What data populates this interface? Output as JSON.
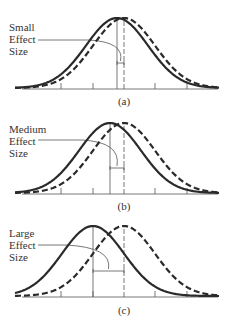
{
  "colors": {
    "curve": "#2a2a2a",
    "axis": "#555555",
    "text": "#333333"
  },
  "chart_data": [
    {
      "type": "line",
      "title": "",
      "caption": "(a)",
      "annotation": [
        "Small",
        "Effect",
        "Size"
      ],
      "series": [
        {
          "name": "distribution-1",
          "style": "solid",
          "mean_x_px": 117
        },
        {
          "name": "distribution-2",
          "style": "dashed",
          "mean_x_px": 124
        }
      ],
      "effect_size": "small",
      "grid": false
    },
    {
      "type": "line",
      "title": "",
      "caption": "(b)",
      "annotation": [
        "Medium",
        "Effect",
        "Size"
      ],
      "series": [
        {
          "name": "distribution-1",
          "style": "solid",
          "mean_x_px": 110
        },
        {
          "name": "distribution-2",
          "style": "dashed",
          "mean_x_px": 124
        }
      ],
      "effect_size": "medium",
      "grid": false
    },
    {
      "type": "line",
      "title": "",
      "caption": "(c)",
      "annotation": [
        "Large",
        "Effect",
        "Size"
      ],
      "series": [
        {
          "name": "distribution-1",
          "style": "solid",
          "mean_x_px": 93
        },
        {
          "name": "distribution-2",
          "style": "dashed",
          "mean_x_px": 124
        }
      ],
      "effect_size": "large",
      "grid": false
    }
  ],
  "panels": [
    {
      "label_lines": [
        "Small",
        "Effect",
        "Size"
      ],
      "caption": "(a)"
    },
    {
      "label_lines": [
        "Medium",
        "Effect",
        "Size"
      ],
      "caption": "(b)"
    },
    {
      "label_lines": [
        "Large",
        "Effect",
        "Size"
      ],
      "caption": "(c)"
    }
  ]
}
